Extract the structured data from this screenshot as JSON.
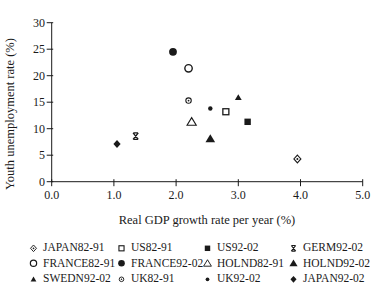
{
  "figure": {
    "background_color": "#ffffff",
    "ink_color": "#1a1a1a"
  },
  "chart_data": {
    "type": "scatter",
    "title": "",
    "xlabel": "Real GDP growth rate per year (%)",
    "ylabel": "Youth unemployment rate (%)",
    "xlim": [
      0,
      5
    ],
    "ylim": [
      0,
      30
    ],
    "xticks": [
      "0.0",
      "1.0",
      "2.0",
      "3.0",
      "4.0",
      "5.0"
    ],
    "yticks": [
      "0",
      "5",
      "10",
      "15",
      "20",
      "25",
      "30"
    ],
    "grid": false,
    "legend_position": "bottom",
    "legend_columns": 4,
    "series": [
      {
        "name": "JAPAN82-91",
        "marker": "diamond-dot",
        "x": 3.95,
        "y": 4.3
      },
      {
        "name": "US82-91",
        "marker": "square-open",
        "x": 2.8,
        "y": 13.2
      },
      {
        "name": "US92-02",
        "marker": "square-filled",
        "x": 3.15,
        "y": 11.3
      },
      {
        "name": "GERM92-02",
        "marker": "x-bars",
        "x": 1.35,
        "y": 8.6
      },
      {
        "name": "FRANCE82-91",
        "marker": "circle-open",
        "x": 2.2,
        "y": 21.4
      },
      {
        "name": "FRANCE92-02",
        "marker": "circle-filled",
        "x": 1.95,
        "y": 24.5
      },
      {
        "name": "HOLND82-91",
        "marker": "triangle-open",
        "x": 2.25,
        "y": 11.3
      },
      {
        "name": "HOLND92-02",
        "marker": "triangle-filled",
        "x": 2.55,
        "y": 8.1
      },
      {
        "name": "SWEDN92-02",
        "marker": "triangle-filled-small",
        "x": 3.0,
        "y": 15.9
      },
      {
        "name": "UK82-91",
        "marker": "circle-dot",
        "x": 2.2,
        "y": 15.3
      },
      {
        "name": "UK92-02",
        "marker": "circle-filled-small",
        "x": 2.55,
        "y": 13.8
      },
      {
        "name": "JAPAN92-02",
        "marker": "diamond-filled",
        "x": 1.05,
        "y": 7.1
      }
    ]
  }
}
